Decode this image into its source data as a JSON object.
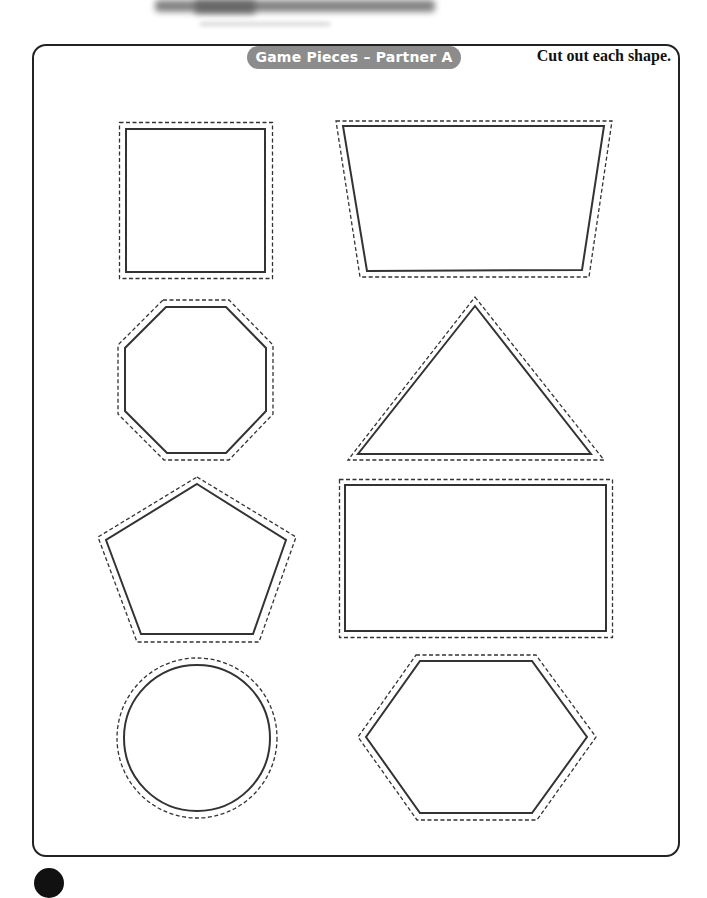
{
  "page": {
    "header_bleed": "",
    "title_pill": "Game Pieces – Partner A",
    "instruction": "Cut out each shape."
  },
  "shapes": [
    {
      "name": "square",
      "label": "Square"
    },
    {
      "name": "trapezoid",
      "label": "Trapezoid"
    },
    {
      "name": "octagon",
      "label": "Octagon"
    },
    {
      "name": "triangle",
      "label": "Triangle"
    },
    {
      "name": "pentagon",
      "label": "Pentagon"
    },
    {
      "name": "rectangle",
      "label": "Rectangle"
    },
    {
      "name": "circle",
      "label": "Circle"
    },
    {
      "name": "hexagon",
      "label": "Hexagon"
    }
  ],
  "colors": {
    "pill_bg": "#8c8c8c",
    "pill_text": "#ffffff",
    "outline": "#333333",
    "frame": "#222222"
  }
}
